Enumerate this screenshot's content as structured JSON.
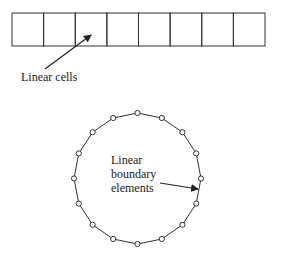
{
  "labels": {
    "linear_cells": "Linear cells",
    "boundary_line1": "Linear",
    "boundary_line2": "boundary",
    "boundary_line3": "elements"
  },
  "cells": {
    "count": 8,
    "x": 12,
    "y": 13,
    "width": 253,
    "height": 33
  },
  "circle": {
    "cx": 137.5,
    "cy": 178.5,
    "rx": 63.5,
    "ry": 65.5,
    "node_count": 16,
    "node_radius": 2.6
  },
  "colors": {
    "stroke": "#333333",
    "background": "#ffffff"
  }
}
